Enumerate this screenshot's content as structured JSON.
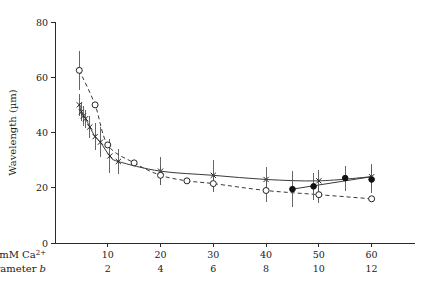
{
  "chart_data": {
    "type": "line",
    "title": "",
    "subtitle": "",
    "xlabel": "mM Ca2+",
    "ylabel": "Wavelength (µm)",
    "xlim": [
      0,
      65
    ],
    "ylim": [
      0,
      80
    ],
    "grid": false,
    "legend_position": "none",
    "y_ticks": [
      0,
      20,
      40,
      60,
      80
    ],
    "y_tick_labels": [
      "0",
      "20",
      "40",
      "60",
      "80"
    ],
    "x_ticks": [
      10,
      20,
      30,
      40,
      50,
      60
    ],
    "x_axis_rows": [
      {
        "label": "mM Ca",
        "label_superscript": "2+",
        "tick_labels": [
          "10",
          "20",
          "30",
          "40",
          "50",
          "60"
        ]
      },
      {
        "label": "Parameter",
        "label_italic": "b",
        "tick_labels": [
          "2",
          "4",
          "6",
          "8",
          "10",
          "12"
        ]
      }
    ],
    "series": [
      {
        "name": "solid-cross-series",
        "marker": "cross",
        "line_style": "solid",
        "points": [
          {
            "x": 4.6,
            "y": 50.0,
            "err": 4.0
          },
          {
            "x": 5.0,
            "y": 47.5,
            "err": 3.5
          },
          {
            "x": 5.4,
            "y": 46.0,
            "err": 3.5
          },
          {
            "x": 5.8,
            "y": 45.0,
            "err": 3.2
          },
          {
            "x": 6.6,
            "y": 42.0,
            "err": 4.0
          },
          {
            "x": 7.6,
            "y": 38.5,
            "err": 5.0
          },
          {
            "x": 8.6,
            "y": 36.5,
            "err": 5.5
          },
          {
            "x": 10.4,
            "y": 31.5,
            "err": 6.0
          },
          {
            "x": 12.0,
            "y": 29.5,
            "err": 4.5
          },
          {
            "x": 20.0,
            "y": 26.0,
            "err": 5.0
          },
          {
            "x": 30.0,
            "y": 24.5,
            "err": 5.5
          },
          {
            "x": 40.0,
            "y": 23.0,
            "err": 4.5
          },
          {
            "x": 50.0,
            "y": 22.5,
            "err": 4.0
          },
          {
            "x": 60.0,
            "y": 24.0,
            "err": 4.5
          }
        ]
      },
      {
        "name": "dashed-open-circle-series",
        "marker": "open-circle",
        "line_style": "dashed",
        "points": [
          {
            "x": 4.6,
            "y": 62.5,
            "err": 7.0
          },
          {
            "x": 7.6,
            "y": 50.0,
            "err": 0
          },
          {
            "x": 10.0,
            "y": 35.5,
            "err": 0
          },
          {
            "x": 15.0,
            "y": 29.0,
            "err": 0
          },
          {
            "x": 20.0,
            "y": 24.5,
            "err": 3.5
          },
          {
            "x": 25.0,
            "y": 22.5,
            "err": 0
          },
          {
            "x": 30.0,
            "y": 21.5,
            "err": 3.0
          },
          {
            "x": 40.0,
            "y": 19.0,
            "err": 4.0
          },
          {
            "x": 50.0,
            "y": 17.5,
            "err": 3.0
          },
          {
            "x": 60.0,
            "y": 16.0,
            "err": 0
          }
        ]
      },
      {
        "name": "filled-circle-series",
        "marker": "filled-circle",
        "line_style": "none",
        "points": [
          {
            "x": 45.0,
            "y": 19.5,
            "err": 6.5
          },
          {
            "x": 49.0,
            "y": 20.5,
            "err": 5.0
          },
          {
            "x": 55.0,
            "y": 23.5,
            "err": 4.5
          },
          {
            "x": 60.0,
            "y": 23.0,
            "err": 5.0
          }
        ]
      }
    ]
  }
}
